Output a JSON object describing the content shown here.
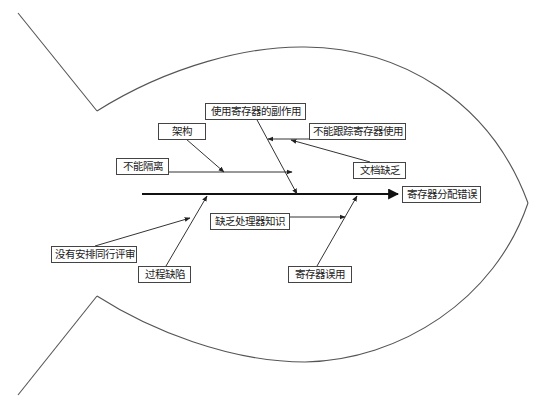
{
  "diagram": {
    "type": "fishbone",
    "head": {
      "label": "寄存器分配错误"
    },
    "causes": {
      "side_effects": {
        "label": "使用寄存器的副作用"
      },
      "architecture": {
        "label": "架构"
      },
      "no_isolation": {
        "label": "不能隔离"
      },
      "cannot_track": {
        "label": "不能跟踪寄存器使用"
      },
      "lack_docs": {
        "label": "文档缺乏"
      },
      "lack_processor_knowledge": {
        "label": "缺乏处理器知识"
      },
      "no_peer_review": {
        "label": "没有安排同行评审"
      },
      "process_defect": {
        "label": "过程缺陷"
      },
      "register_misuse": {
        "label": "寄存器误用"
      }
    },
    "colors": {
      "line": "#444444",
      "spine": "#111111",
      "background": "#ffffff"
    }
  }
}
